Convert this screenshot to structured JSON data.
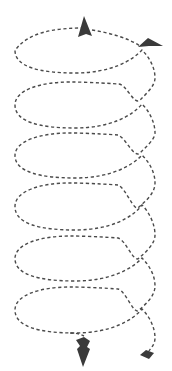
{
  "diagram": {
    "type": "spiral-helix",
    "loop_count": 6,
    "colors": {
      "background": "#ffffff",
      "dash_stroke": "#4a4a4a",
      "marker_fill": "#3a3a3a"
    },
    "loops": [
      {
        "index": 1,
        "top_y": 28,
        "bottom_y": 73,
        "crossing": [
          140,
          100
        ]
      },
      {
        "index": 2,
        "top_y": 82,
        "bottom_y": 128,
        "crossing": [
          140,
          153
        ]
      },
      {
        "index": 3,
        "top_y": 133,
        "bottom_y": 178,
        "crossing": [
          139,
          207
        ]
      },
      {
        "index": 4,
        "top_y": 183,
        "bottom_y": 230,
        "crossing": [
          139,
          258
        ]
      },
      {
        "index": 5,
        "top_y": 236,
        "bottom_y": 281,
        "crossing": [
          139,
          310
        ]
      },
      {
        "index": 6,
        "top_y": 287,
        "bottom_y": 333,
        "crossing": null
      }
    ],
    "markers": [
      {
        "name": "top-arrowhead",
        "direction": "up"
      },
      {
        "name": "right-arrowhead",
        "direction": "right"
      },
      {
        "name": "bottom-arrowhead",
        "direction": "down"
      },
      {
        "name": "end-diamond",
        "direction": "none"
      }
    ]
  }
}
